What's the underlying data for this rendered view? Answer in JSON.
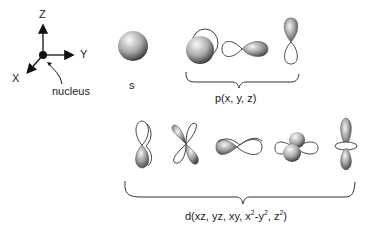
{
  "axes": {
    "z_label": "Z",
    "y_label": "Y",
    "x_label": "X",
    "nucleus_label": "nucleus"
  },
  "orbitals": {
    "s": {
      "label": "s"
    },
    "p": {
      "label": "p(x, y, z)",
      "shapes": [
        "px",
        "py",
        "pz"
      ]
    },
    "d": {
      "label_prefix": "d(xz, yz, xy, x",
      "label_sup1": "2",
      "label_mid": "-y",
      "label_sup2": "2",
      "label_mid2": ", z",
      "label_sup3": "2",
      "label_suffix": ")",
      "shapes": [
        "dxz",
        "dyz",
        "dxy",
        "dx2-y2",
        "dz2"
      ]
    }
  },
  "colors": {
    "lobe_dark": "#3a3a3a",
    "lobe_light": "#f4f4f4",
    "outline": "#444444"
  }
}
